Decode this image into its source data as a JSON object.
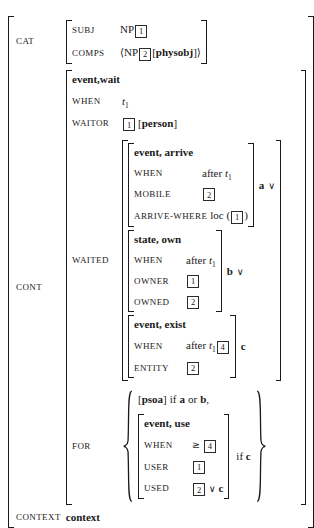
{
  "colors": {
    "text": "#1a1a1a",
    "background": "#ffffff"
  },
  "cat": {
    "label": "CAT",
    "subj_attr": "SUBJ",
    "subj_head": "NP",
    "subj_tag": "1",
    "comps_attr": "COMPS",
    "comps_open": "⟨",
    "comps_head": "NP",
    "comps_tag": "2",
    "comps_bra": "[",
    "comps_type": "physobj",
    "comps_ket": "]",
    "comps_close": "⟩"
  },
  "cont": {
    "label": "CONT",
    "type_line": "event,wait",
    "when_attr": "WHEN",
    "when_var": "t",
    "when_sub": "1",
    "waitor_attr": "WAITOR",
    "waitor_tag": "1",
    "waitor_bra": "[",
    "waitor_type": "person",
    "waitor_ket": "]",
    "waited_attr": "WAITED",
    "for_attr": "FOR"
  },
  "arrive": {
    "type_line": "event, arrive",
    "when_attr": "WHEN",
    "when_pre": "after",
    "when_var": "t",
    "when_sub": "1",
    "mobile_attr": "MOBILE",
    "mobile_tag": "2",
    "where_attr": "ARRIVE-WHERE",
    "where_fn": "loc",
    "where_open": "(",
    "where_tag": "1",
    "where_close": ")",
    "label": "a",
    "vee": "∨"
  },
  "own": {
    "type_line": "state, own",
    "when_attr": "WHEN",
    "when_pre": "after",
    "when_var": "t",
    "when_sub": "1",
    "owner_attr": "OWNER",
    "owner_tag": "1",
    "owned_attr": "OWNED",
    "owned_tag": "2",
    "label": "b",
    "vee": "∨"
  },
  "exist": {
    "type_line": "event, exist",
    "when_attr": "WHEN",
    "when_pre": "after",
    "when_var": "t",
    "when_sub": "1",
    "when_tag": "4",
    "entity_attr": "ENTITY",
    "entity_tag": "2",
    "label": "c"
  },
  "forset": {
    "psoa_bra": "[",
    "psoa_type": "psoa",
    "psoa_ket": "]",
    "psoa_if": "if",
    "psoa_a": "a",
    "psoa_or": "or",
    "psoa_b": "b",
    "psoa_comma": ",",
    "use_type_line": "event, use",
    "use_when_attr": "WHEN",
    "use_when_op": "≥",
    "use_when_tag": "4",
    "use_user_attr": "USER",
    "use_user_tag": "1",
    "use_used_attr": "USED",
    "use_used_tag": "2",
    "use_used_vee": "∨",
    "use_used_c": "c",
    "cond_if": "if",
    "cond_c": "c"
  },
  "context": {
    "label": "CONTEXT",
    "value": "context"
  }
}
